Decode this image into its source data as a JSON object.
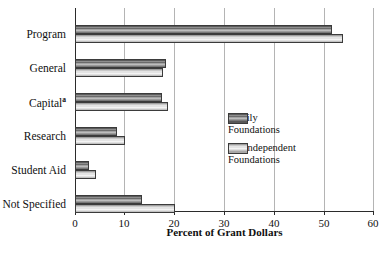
{
  "chart_data": {
    "type": "bar",
    "orientation": "horizontal",
    "title": "",
    "xlabel": "Percent of Grant Dollars",
    "ylabel": "",
    "xlim": [
      0,
      60
    ],
    "xticks": [
      0,
      10,
      20,
      30,
      40,
      50,
      60
    ],
    "grid": "vertical",
    "legend_position": "middle-right-inside",
    "categories": [
      "Program",
      "General",
      "Capital",
      "Research",
      "Student Aid",
      "Not Specified"
    ],
    "category_footnotes": [
      "",
      "",
      "a",
      "",
      "",
      ""
    ],
    "series": [
      {
        "name": "Family Foundations",
        "color": "#6e6e6e",
        "values": [
          51.6,
          18.3,
          17.5,
          8.4,
          2.8,
          13.5
        ]
      },
      {
        "name": "All Independent Foundations",
        "color": "#dcdcdc",
        "values": [
          53.8,
          17.7,
          18.7,
          10.0,
          4.2,
          20.0
        ]
      }
    ]
  },
  "axis": {
    "tick_labels": [
      "0",
      "10",
      "20",
      "30",
      "40",
      "50",
      "60"
    ],
    "x_title": "Percent of Grant Dollars"
  },
  "categories": {
    "program": "Program",
    "general": "General",
    "capital": "Capital",
    "capital_footnote": "a",
    "research": "Research",
    "student_aid": "Student Aid",
    "not_specified": "Not Specified"
  },
  "legend": {
    "items": [
      {
        "label": "Family\nFoundations",
        "swatch": "dark"
      },
      {
        "label": "All Independent\nFoundations",
        "swatch": "light"
      }
    ],
    "family_label": "Family\nFoundations",
    "all_independent_label": "All Independent\nFoundations"
  }
}
